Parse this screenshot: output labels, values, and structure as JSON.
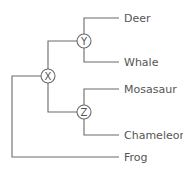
{
  "nodes": {
    "x": "X",
    "y": "Y",
    "z": "Z"
  },
  "leaves": [
    "Deer",
    "Whale",
    "Mosasaur",
    "Chameleon",
    "Frog"
  ]
}
